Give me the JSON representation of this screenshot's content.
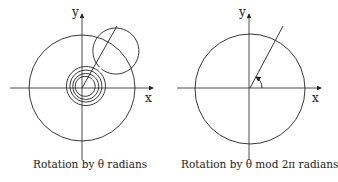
{
  "diagrams": [
    {
      "id": "left",
      "axis_labels": {
        "x": "x",
        "y": "y"
      },
      "caption": "Rotation by θ radians",
      "angle_label": "θ"
    },
    {
      "id": "right",
      "axis_labels": {
        "x": "x",
        "y": "y"
      },
      "caption": "Rotation by θ mod 2π radians",
      "angle_label": "θ mod 2π"
    }
  ],
  "colors": {
    "stroke": "#222222",
    "background": "#ffffff"
  }
}
